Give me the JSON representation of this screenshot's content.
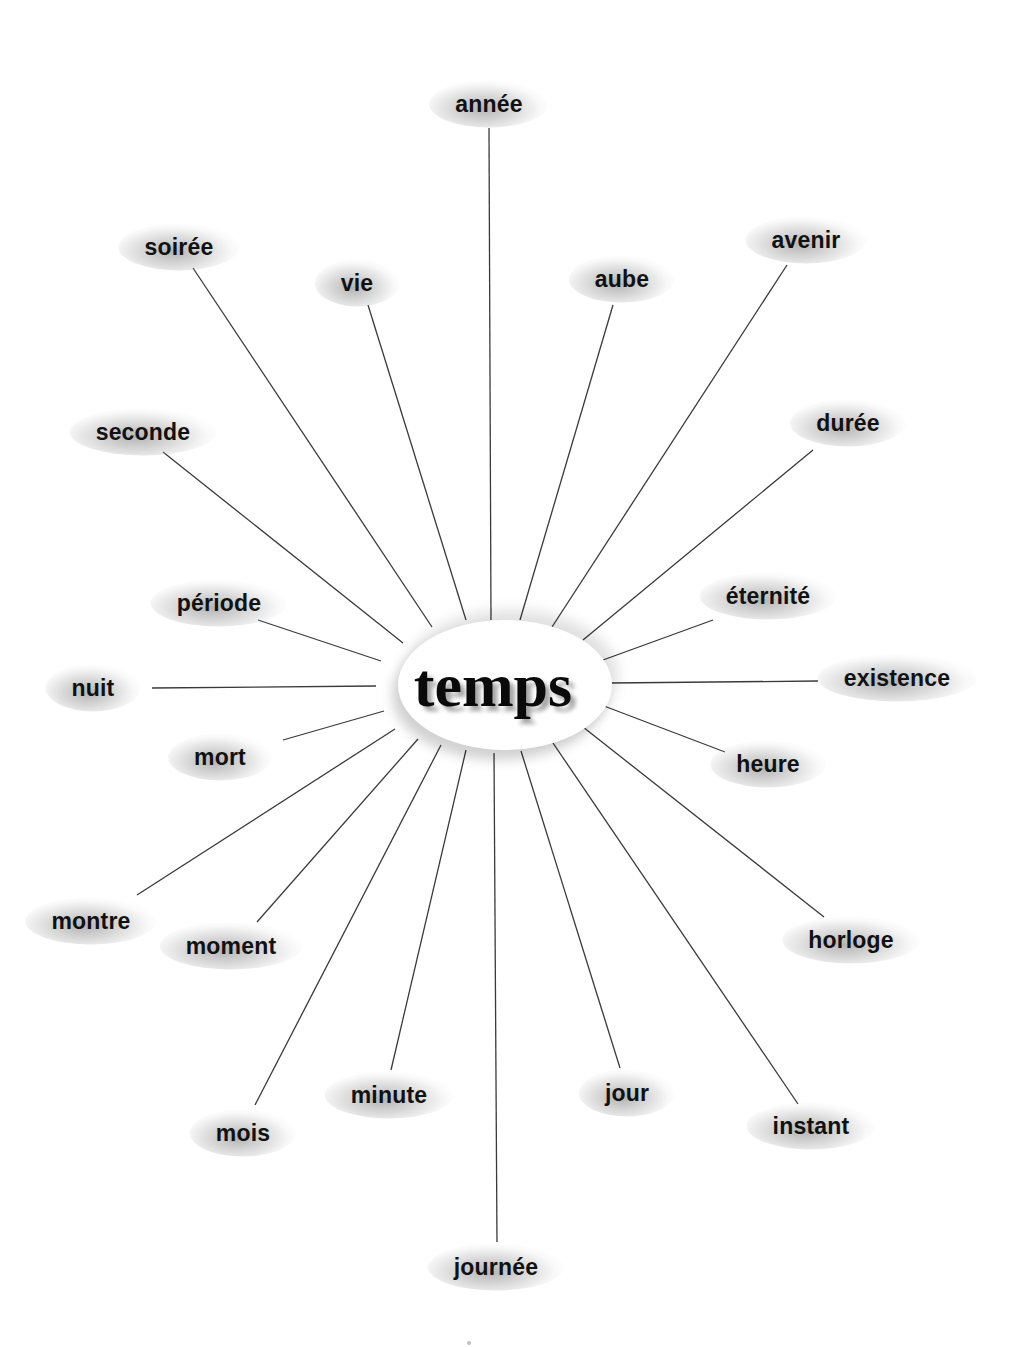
{
  "center": {
    "label": "temps",
    "x": 493,
    "y": 685
  },
  "words": [
    {
      "id": "annee",
      "label": "année",
      "x": 489,
      "y": 104,
      "line": [
        489,
        128,
        491,
        620
      ]
    },
    {
      "id": "soiree",
      "label": "soirée",
      "x": 179,
      "y": 247,
      "line": [
        193,
        268,
        432,
        627
      ]
    },
    {
      "id": "vie",
      "label": "vie",
      "x": 357,
      "y": 283,
      "line": [
        368,
        305,
        466,
        620
      ]
    },
    {
      "id": "aube",
      "label": "aube",
      "x": 622,
      "y": 279,
      "line": [
        613,
        305,
        520,
        620
      ]
    },
    {
      "id": "avenir",
      "label": "avenir",
      "x": 806,
      "y": 240,
      "line": [
        787,
        265,
        552,
        627
      ]
    },
    {
      "id": "seconde",
      "label": "seconde",
      "x": 143,
      "y": 432,
      "line": [
        163,
        452,
        403,
        643
      ]
    },
    {
      "id": "duree",
      "label": "durée",
      "x": 848,
      "y": 423,
      "line": [
        813,
        450,
        583,
        640
      ]
    },
    {
      "id": "periode",
      "label": "période",
      "x": 219,
      "y": 603,
      "line": [
        258,
        620,
        381,
        661
      ]
    },
    {
      "id": "eternite",
      "label": "éternité",
      "x": 768,
      "y": 596,
      "line": [
        713,
        620,
        603,
        660
      ]
    },
    {
      "id": "nuit",
      "label": "nuit",
      "x": 93,
      "y": 688,
      "line": [
        152,
        688,
        376,
        686
      ]
    },
    {
      "id": "existence",
      "label": "existence",
      "x": 897,
      "y": 678,
      "line": [
        611,
        683,
        818,
        681
      ]
    },
    {
      "id": "mort",
      "label": "mort",
      "x": 220,
      "y": 757,
      "line": [
        283,
        740,
        384,
        711
      ]
    },
    {
      "id": "heure",
      "label": "heure",
      "x": 768,
      "y": 764,
      "line": [
        604,
        706,
        725,
        752
      ]
    },
    {
      "id": "montre",
      "label": "montre",
      "x": 91,
      "y": 921,
      "line": [
        137,
        895,
        395,
        729
      ]
    },
    {
      "id": "horloge",
      "label": "horloge",
      "x": 851,
      "y": 940,
      "line": [
        583,
        727,
        824,
        917
      ]
    },
    {
      "id": "moment",
      "label": "moment",
      "x": 231,
      "y": 946,
      "line": [
        257,
        922,
        418,
        739
      ]
    },
    {
      "id": "mois",
      "label": "mois",
      "x": 243,
      "y": 1133,
      "line": [
        255,
        1105,
        441,
        745
      ]
    },
    {
      "id": "minute",
      "label": "minute",
      "x": 389,
      "y": 1095,
      "line": [
        391,
        1070,
        466,
        750
      ]
    },
    {
      "id": "jour",
      "label": "jour",
      "x": 627,
      "y": 1093,
      "line": [
        521,
        751,
        620,
        1068
      ]
    },
    {
      "id": "instant",
      "label": "instant",
      "x": 811,
      "y": 1126,
      "line": [
        553,
        743,
        798,
        1104
      ]
    },
    {
      "id": "journee",
      "label": "journée",
      "x": 496,
      "y": 1267,
      "line": [
        494,
        753,
        497,
        1242
      ]
    }
  ],
  "colors": {
    "line": "#3a3a3a",
    "text": "#111111",
    "background": "#ffffff"
  }
}
